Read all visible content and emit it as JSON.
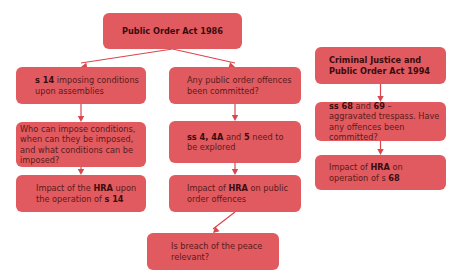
{
  "diagram": {
    "colors": {
      "box_fill": "#e05a5f",
      "text": "#5a1a1c",
      "arrow": "#d9464c"
    },
    "nodes": [
      {
        "id": "poa1986",
        "parts": [
          {
            "t": "Public Order Act 1986",
            "b": true
          }
        ]
      },
      {
        "id": "s14",
        "parts": [
          {
            "t": "s 14",
            "b": true
          },
          {
            "t": " imposing conditions upon assemblies",
            "b": false
          }
        ]
      },
      {
        "id": "offences",
        "parts": [
          {
            "t": "Any public order offences been committed?",
            "b": false
          }
        ]
      },
      {
        "id": "who",
        "parts": [
          {
            "t": "Who can impose conditions, when can they be imposed, and what conditions can be imposed?",
            "b": false
          }
        ]
      },
      {
        "id": "ss445",
        "parts": [
          {
            "t": "ss 4, 4A",
            "b": true
          },
          {
            "t": " and ",
            "b": false
          },
          {
            "t": "5",
            "b": true
          },
          {
            "t": " need to be explored",
            "b": false
          }
        ]
      },
      {
        "id": "hra14",
        "parts": [
          {
            "t": "Impact of the ",
            "b": false
          },
          {
            "t": "HRA",
            "b": true
          },
          {
            "t": " upon the operation of ",
            "b": false
          },
          {
            "t": "s 14",
            "b": true
          }
        ]
      },
      {
        "id": "hrapub",
        "parts": [
          {
            "t": "Impact of ",
            "b": false
          },
          {
            "t": "HRA",
            "b": true
          },
          {
            "t": " on public order offences",
            "b": false
          }
        ]
      },
      {
        "id": "breach",
        "parts": [
          {
            "t": "Is breach of the peace relevant?",
            "b": false
          }
        ]
      },
      {
        "id": "cjpoa",
        "parts": [
          {
            "t": "Criminal Justice and Public Order Act 1994",
            "b": true
          }
        ]
      },
      {
        "id": "ss6869",
        "parts": [
          {
            "t": "ss 68",
            "b": true
          },
          {
            "t": " and ",
            "b": false
          },
          {
            "t": "69",
            "b": true
          },
          {
            "t": " – aggravated trespass. Have any offences been committed?",
            "b": false
          }
        ]
      },
      {
        "id": "hra68",
        "parts": [
          {
            "t": "Impact of ",
            "b": false
          },
          {
            "t": "HRA",
            "b": true
          },
          {
            "t": " on operation of s ",
            "b": false
          },
          {
            "t": "68",
            "b": true
          }
        ]
      }
    ],
    "edges": [
      [
        "poa1986",
        "s14"
      ],
      [
        "poa1986",
        "offences"
      ],
      [
        "s14",
        "who"
      ],
      [
        "who",
        "hra14"
      ],
      [
        "offences",
        "ss445"
      ],
      [
        "ss445",
        "hrapub"
      ],
      [
        "hrapub",
        "breach"
      ],
      [
        "cjpoa",
        "ss6869"
      ],
      [
        "ss6869",
        "hra68"
      ]
    ]
  }
}
